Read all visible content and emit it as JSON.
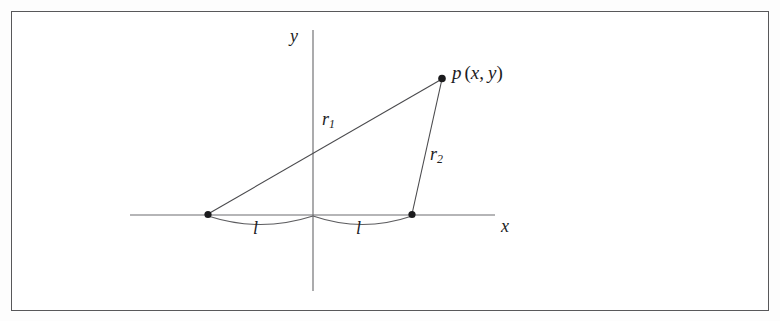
{
  "figure": {
    "kind": "geometry-diagram",
    "background_color": "#ffffff",
    "frame_color": "#58585a",
    "line_color": "#5c5c5f",
    "text_color": "#1c1c1e"
  },
  "axes": {
    "y_label": "y",
    "x_label": "x",
    "origin": {
      "x": 313,
      "y": 215
    },
    "x_axis": {
      "x1": 130,
      "y1": 215,
      "x2": 495,
      "y2": 215
    },
    "y_axis": {
      "x1": 313,
      "y1": 30,
      "x2": 313,
      "y2": 291
    }
  },
  "points": {
    "p": {
      "label_base": "p",
      "label_open": "(",
      "label_x": "x",
      "label_comma": ",",
      "label_y": "y",
      "label_close": ")",
      "x": 442,
      "y": 78
    },
    "focus_left": {
      "x": 208,
      "y": 215
    },
    "focus_right": {
      "x": 412,
      "y": 215
    }
  },
  "segments": [
    {
      "name": "r1",
      "label_base": "r",
      "label_sub": "1",
      "from": "focus_left",
      "to": "p"
    },
    {
      "name": "r2",
      "label_base": "r",
      "label_sub": "2",
      "from": "focus_right",
      "to": "p"
    }
  ],
  "braces": [
    {
      "name": "l-left",
      "label": "l",
      "from_x": 208,
      "to_x": 313,
      "baseline_y": 215,
      "depth": 9
    },
    {
      "name": "l-right",
      "label": "l",
      "from_x": 313,
      "to_x": 412,
      "baseline_y": 215,
      "depth": 9
    }
  ]
}
